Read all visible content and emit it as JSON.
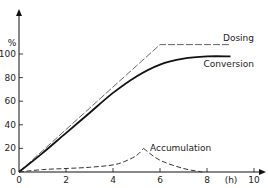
{
  "chart_data": {
    "type": "line",
    "title": "",
    "xlabel": "(h)",
    "ylabel": "%",
    "xlim": [
      0,
      10
    ],
    "ylim": [
      0,
      115
    ],
    "x_ticks": [
      "0",
      "2",
      "4",
      "6",
      "8",
      "10"
    ],
    "y_ticks": [
      "0",
      "20",
      "40",
      "60",
      "80",
      "100"
    ],
    "grid": false,
    "legend": "inline labels",
    "series": [
      {
        "name": "Dosing",
        "style": "dashed-thin",
        "x": [
          0,
          1,
          2,
          3,
          4,
          5,
          6,
          7,
          8,
          9
        ],
        "values": [
          0,
          18,
          36,
          54,
          72,
          90,
          108,
          108,
          108,
          108
        ]
      },
      {
        "name": "Conversion",
        "style": "solid-thick",
        "x": [
          0,
          1,
          2,
          3,
          4,
          5,
          6,
          7,
          8,
          9
        ],
        "values": [
          0,
          16,
          33,
          50,
          67,
          81,
          91,
          96,
          98,
          98
        ]
      },
      {
        "name": "Accumulation",
        "style": "dashed",
        "x": [
          0,
          1,
          2,
          3,
          4,
          4.5,
          5,
          5.3,
          6,
          7,
          7.8
        ],
        "values": [
          0,
          2,
          3,
          4,
          6,
          9,
          14,
          20,
          10,
          3,
          0
        ]
      }
    ]
  }
}
